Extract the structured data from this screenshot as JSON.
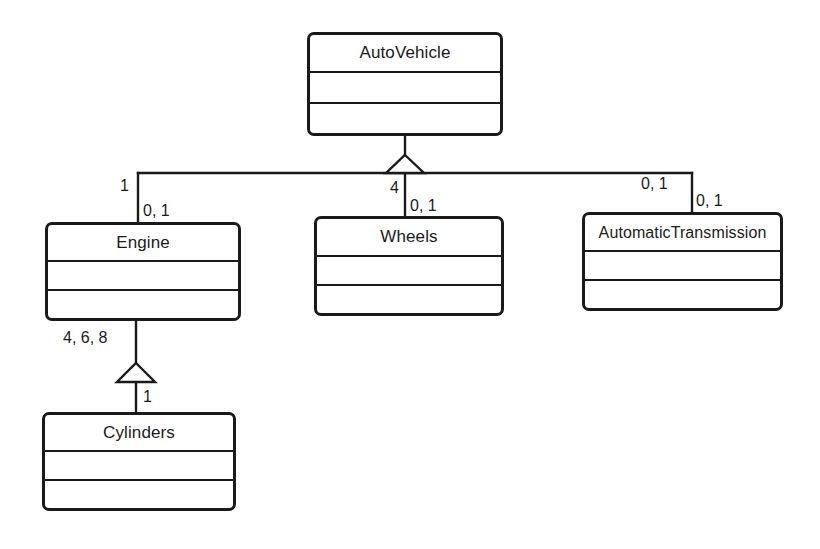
{
  "diagram": {
    "type": "uml-class-diagram",
    "background_color": "#ffffff",
    "line_color": "#1a1a1a",
    "text_color": "#1a1a1a",
    "classes": [
      {
        "id": "autovehicle",
        "name": "AutoVehicle",
        "attributes": "",
        "operations": ""
      },
      {
        "id": "engine",
        "name": "Engine",
        "attributes": "",
        "operations": ""
      },
      {
        "id": "wheels",
        "name": "Wheels",
        "attributes": "",
        "operations": ""
      },
      {
        "id": "automatictransmission",
        "name": "AutomaticTransmission",
        "attributes": "",
        "operations": ""
      },
      {
        "id": "cylinders",
        "name": "Cylinders",
        "attributes": "",
        "operations": ""
      }
    ],
    "multiplicity_labels": {
      "engine_upper": "1",
      "engine_lower": "0, 1",
      "wheels_upper": "4",
      "wheels_lower": "0, 1",
      "transmission_upper": "0, 1",
      "transmission_lower": "0, 1",
      "cylinders_upper": "4, 6, 8",
      "cylinders_lower": "1"
    }
  }
}
